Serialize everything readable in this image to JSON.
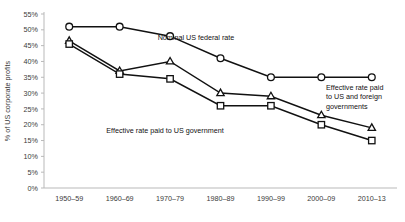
{
  "chart_data": {
    "type": "line",
    "title": "",
    "subtitle": "",
    "xlabel": "",
    "ylabel": "% of US corporate profits",
    "categories": [
      "1950–59",
      "1960–69",
      "1970–79",
      "1980–89",
      "1990–99",
      "2000–09",
      "2010–13"
    ],
    "ylim": [
      0,
      55
    ],
    "ytick_step": 5,
    "ytick_labels": [
      "0%",
      "5%",
      "10%",
      "15%",
      "20%",
      "25%",
      "30%",
      "35%",
      "40%",
      "45%",
      "50%",
      "55%"
    ],
    "ytick_values": [
      0,
      5,
      10,
      15,
      20,
      25,
      30,
      35,
      40,
      45,
      50,
      55
    ],
    "grid": false,
    "legend": "none",
    "series": [
      {
        "name": "Nominal US federal rate",
        "marker": "circle",
        "color": "#111111",
        "values": [
          51,
          51,
          48,
          41,
          35,
          35,
          35
        ]
      },
      {
        "name": "Effective rate paid to US and foreign governments",
        "marker": "triangle",
        "color": "#111111",
        "values": [
          46.5,
          37,
          40,
          30,
          29,
          23,
          19
        ]
      },
      {
        "name": "Effective rate paid to US government",
        "marker": "square",
        "color": "#111111",
        "values": [
          45.5,
          36,
          34.5,
          26,
          26,
          20,
          15
        ]
      }
    ],
    "annotations": [
      {
        "id": "nominal",
        "lines": [
          "Nominal US federal rate"
        ],
        "x": 196,
        "y": 40,
        "anchor": "middle"
      },
      {
        "id": "foreign",
        "lines": [
          "Effective rate paid",
          "to US and foreign",
          "governments"
        ],
        "x": 326,
        "y": 90,
        "anchor": "start"
      },
      {
        "id": "usgov",
        "lines": [
          "Effective rate paid to US government"
        ],
        "x": 165,
        "y": 133,
        "anchor": "middle"
      }
    ]
  },
  "colors": {
    "ink": "#111111",
    "axis": "#b9b9b9",
    "label": "#3a3a3a",
    "background": "#ffffff"
  }
}
